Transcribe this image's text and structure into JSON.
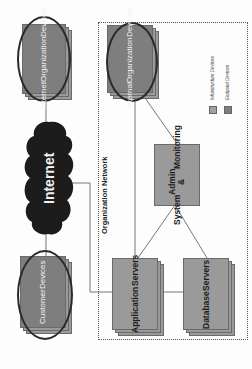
{
  "diagram": {
    "orientation": "rotated 90 degrees counter-clockwise",
    "nodes": {
      "internet_org_devices": {
        "label": "Internet Organization Devices",
        "lines": [
          "Internet",
          "Organization",
          "Devices"
        ]
      },
      "internet": {
        "label": "Internet"
      },
      "customer_devices": {
        "label": "Customer Devices",
        "lines": [
          "Customer",
          "Devices"
        ]
      },
      "internal_org_devices": {
        "label": "Internal Organization Devices",
        "lines": [
          "Internal",
          "Organization",
          "Devices"
        ]
      },
      "system_admin": {
        "label": "System Admin & Monitoring",
        "lines": [
          "System",
          "Admin &",
          "Monitoring"
        ]
      },
      "application_servers": {
        "label": "Application Servers",
        "lines": [
          "Application",
          "Servers"
        ]
      },
      "database_servers": {
        "label": "Database Servers",
        "lines": [
          "Database",
          "Servers"
        ]
      }
    },
    "group": {
      "label": "Organization Network"
    },
    "legend": {
      "items": [
        {
          "label": "Infrastructure Devices",
          "color": "#a0a0a0"
        },
        {
          "label": "Endpoint Devices",
          "color": "#7e7e7e"
        }
      ]
    },
    "edges": [
      [
        "Internet Organization Devices",
        "Internet"
      ],
      [
        "Internet",
        "Customer Devices"
      ],
      [
        "Internet",
        "Application Servers"
      ],
      [
        "Internal Organization Devices",
        "System Admin & Monitoring"
      ],
      [
        "Internal Organization Devices",
        "Application Servers"
      ],
      [
        "System Admin & Monitoring",
        "Application Servers"
      ],
      [
        "System Admin & Monitoring",
        "Database Servers"
      ],
      [
        "Application Servers",
        "Database Servers"
      ]
    ],
    "colors": {
      "endpoint": "#7e7e7e",
      "infrastructure": "#9a9a9a",
      "cloud": "#1c1c1c",
      "ellipse_outline": "#2a2a2a",
      "line": "#777777"
    }
  }
}
